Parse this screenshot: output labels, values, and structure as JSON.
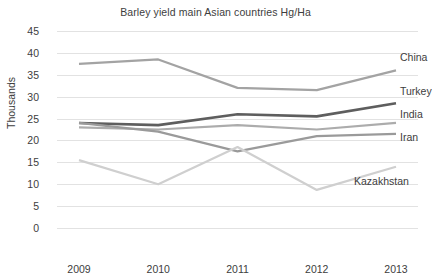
{
  "chart_data": {
    "type": "line",
    "title": "Barley yield main Asian countries Hg/Ha",
    "xlabel": "",
    "ylabel": "Thousands",
    "categories": [
      "2009",
      "2010",
      "2011",
      "2012",
      "2013"
    ],
    "x": [
      2009,
      2010,
      2011,
      2012,
      2013
    ],
    "ylim": [
      0,
      45
    ],
    "yticks": [
      0,
      5,
      10,
      15,
      20,
      25,
      30,
      35,
      40,
      45
    ],
    "ytick_labels": [
      "0",
      "5",
      "10",
      "15",
      "20",
      "25",
      "30",
      "35",
      "40",
      "45"
    ],
    "grid": true,
    "legend_position": "right-inline-labels",
    "series": [
      {
        "name": "China",
        "values": [
          37.5,
          38.5,
          32.0,
          31.5,
          36.0
        ],
        "color": "#a3a3a3"
      },
      {
        "name": "Turkey",
        "values": [
          24.0,
          23.5,
          26.0,
          25.5,
          28.5
        ],
        "color": "#5e5e5e"
      },
      {
        "name": "India",
        "values": [
          23.0,
          22.5,
          23.5,
          22.5,
          24.0
        ],
        "color": "#acacac"
      },
      {
        "name": "Iran",
        "values": [
          24.0,
          22.0,
          17.5,
          21.0,
          21.5
        ],
        "color": "#9a9a9a"
      },
      {
        "name": "Kazakhstan",
        "values": [
          15.5,
          10.0,
          18.5,
          8.7,
          14.0
        ],
        "color": "#cfcfcf"
      }
    ]
  },
  "colors": {
    "background": "#ffffff",
    "gridline": "#e2e2e2",
    "text": "#3d3d3d",
    "china": "#a3a3a3",
    "turkey": "#5e5e5e",
    "india": "#acacac",
    "iran": "#9a9a9a",
    "kazakhstan": "#cfcfcf"
  }
}
